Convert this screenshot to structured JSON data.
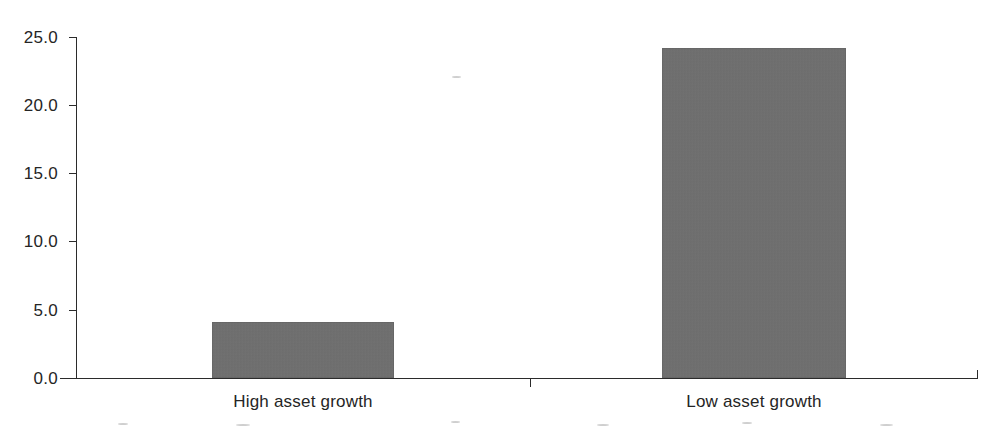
{
  "chart_data": {
    "type": "bar",
    "title": "",
    "subtitle": "",
    "xlabel": "",
    "ylabel": "",
    "categories": [
      "High asset growth",
      "Low asset growth"
    ],
    "values": [
      4.1,
      24.2
    ],
    "series": [
      {
        "name": "",
        "values": [
          4.1,
          24.2
        ]
      }
    ],
    "ylim": [
      0.0,
      25.0
    ],
    "ytick_labels": [
      "0.0",
      "5.0",
      "10.0",
      "15.0",
      "20.0",
      "25.0"
    ],
    "ytick_values": [
      0.0,
      5.0,
      10.0,
      15.0,
      20.0,
      25.0
    ],
    "xtick_labels": [
      "High asset growth",
      "Low asset growth"
    ],
    "grid": false,
    "legend": false,
    "legend_position": "none",
    "annotations": [],
    "bar_color": "#6e6e6e",
    "axis_color": "#2b2b2b",
    "background_color": "#ffffff",
    "text_color": "#252525"
  },
  "axis": {
    "y_labels": [
      "25.0",
      "20.0",
      "15.0",
      "10.0",
      "5.0",
      "0.0"
    ]
  },
  "bars": [
    {
      "label": "High asset growth",
      "value": 4.1
    },
    {
      "label": "Low asset growth",
      "value": 24.2
    }
  ]
}
